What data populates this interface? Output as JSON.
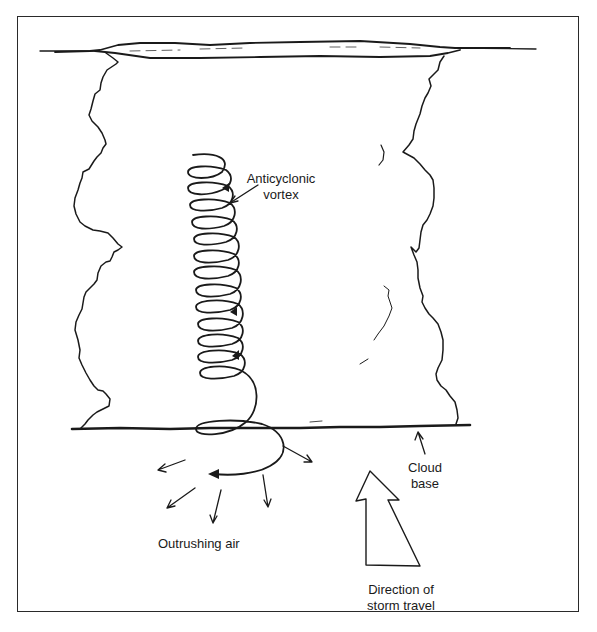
{
  "figure": {
    "type": "schematic-illustration",
    "labels": {
      "vortex": [
        "Anticyclonic",
        "vortex"
      ],
      "cloud_base": [
        "Cloud",
        "base"
      ],
      "outrushing_air": [
        "Outrushing air"
      ],
      "storm_direction": [
        "Direction of",
        "storm travel"
      ]
    },
    "elements": {
      "anvil": "flattened cloud top (anvil)",
      "cloud_body": "towering cumulonimbus outline",
      "cloud_base_line": "horizontal cloud base",
      "vortex_spiral": {
        "loops": 13,
        "arrowheads": 3
      },
      "outrushing_arrows": 6,
      "storm_direction_arrow": "large hollow arrow pointing up"
    },
    "colors": {
      "ink": "#1a1a1a",
      "background": "#ffffff",
      "frame": "#2a2a2a"
    }
  }
}
